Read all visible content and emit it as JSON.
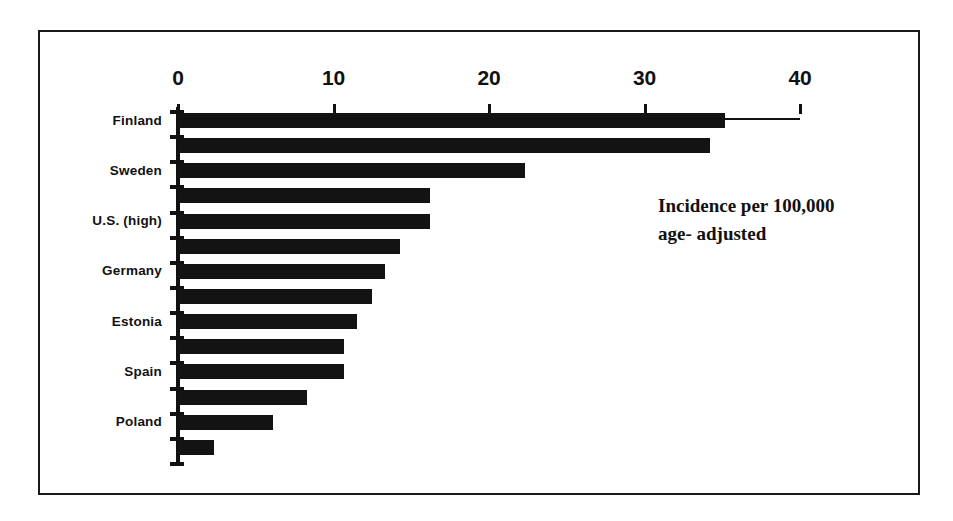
{
  "chart_data": {
    "type": "bar",
    "orientation": "horizontal",
    "title": "",
    "subtitle": "",
    "xlabel": "",
    "ylabel": "",
    "xlim": [
      0,
      40
    ],
    "xticks": [
      0,
      10,
      20,
      30,
      40
    ],
    "xtick_labels": [
      "0",
      "10",
      "20",
      "30",
      "40"
    ],
    "grid": false,
    "legend": null,
    "annotations": [
      "Incidence per 100,000",
      "age- adjusted"
    ],
    "categories": [
      "Finland",
      "",
      "Sweden",
      "",
      "U.S. (high)",
      "",
      "Germany",
      "",
      "Estonia",
      "",
      "Spain",
      "",
      "Poland",
      ""
    ],
    "visible_category_labels": [
      "Finland",
      "Sweden",
      "U.S. (high)",
      "Germany",
      "Estonia",
      "Spain",
      "Poland"
    ],
    "values": [
      35.2,
      34.2,
      22.3,
      16.2,
      16.2,
      14.3,
      13.3,
      12.5,
      11.5,
      10.7,
      10.7,
      8.3,
      6.1,
      2.3
    ],
    "bar_color": "#131313",
    "axis_color": "#111111",
    "background": "#ffffff",
    "frame_color": "#1a1a1a"
  }
}
